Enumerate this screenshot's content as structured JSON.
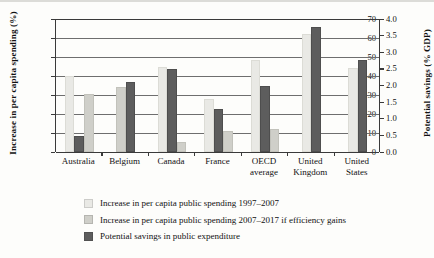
{
  "chart_data": {
    "type": "bar",
    "title": "",
    "categories": [
      "Australia",
      "Belgium",
      "Canada",
      "France",
      "OECD average",
      "United Kingdom",
      "United States"
    ],
    "category_lines": [
      [
        "Australia"
      ],
      [
        "Belgium"
      ],
      [
        "Canada"
      ],
      [
        "France"
      ],
      [
        "OECD",
        "average"
      ],
      [
        "United",
        "Kingdom"
      ],
      [
        "United",
        "States"
      ]
    ],
    "series": [
      {
        "name": "Increase in per capita public spending 1997–2007",
        "axis": "left",
        "color": "#e9e9e5",
        "values": [
          40,
          null,
          45,
          28,
          48.5,
          62,
          44
        ]
      },
      {
        "name": "Increase in per capita public spending 2007–2017 if efficiency gains",
        "axis": "left",
        "color": "#cfcfc9",
        "values": [
          30.5,
          34,
          5.5,
          11,
          12,
          null,
          null
        ]
      },
      {
        "name": "Potential savings in public expenditure",
        "axis": "right",
        "color": "#5d5d5d",
        "values": [
          0.47,
          2.1,
          2.5,
          1.3,
          2.0,
          3.77,
          2.77
        ]
      }
    ],
    "xlabel": "",
    "ylabel": "Increase in per capita spending (%)",
    "ylabel_right": "Potential savings (% GDP)",
    "ylim": [
      0,
      70
    ],
    "ylim_right": [
      0.0,
      4.0
    ],
    "yticks": [
      "0",
      "10",
      "20",
      "30",
      "40",
      "50",
      "60",
      "70"
    ],
    "yticks_right": [
      "0.0",
      "0.5",
      "1.0",
      "1.5",
      "2.0",
      "2.5",
      "3.0",
      "3.5",
      "4.0"
    ],
    "grid": true,
    "legend_position": "below"
  },
  "axes": {
    "left_title": "Increase in per capita spending (%)",
    "right_title": "Potential savings (% GDP)"
  },
  "legend": {
    "items": [
      {
        "label": "Increase in per capita public spending 1997–2007",
        "color": "#e9e9e5"
      },
      {
        "label": "Increase in per capita public spending 2007–2017 if efficiency gains",
        "color": "#cfcfc9"
      },
      {
        "label": "Potential savings in public expenditure",
        "color": "#5d5d5d"
      }
    ]
  }
}
